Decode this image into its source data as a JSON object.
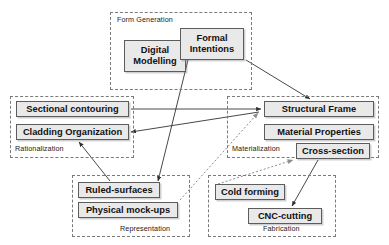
{
  "diagram": {
    "style": {
      "node_fill": "#e9e9e9",
      "node_border": "#5c5c5c",
      "group_border": "#7a7a7a",
      "arrow_color": "#333333",
      "dashed_arrow_color": "#8c8c8c",
      "background": "#ffffff"
    },
    "groups": [
      {
        "id": "form-generation",
        "label": "Form Generation",
        "x": 110,
        "y": 12,
        "w": 142,
        "h": 78,
        "label_x": 116,
        "label_y": 15,
        "label_align": "left"
      },
      {
        "id": "rationalization",
        "label": "Rationalization",
        "x": 10,
        "y": 96,
        "w": 124,
        "h": 62,
        "label_x": 14,
        "label_y": 144,
        "label_align": "left"
      },
      {
        "id": "materialization",
        "label": "Materialization",
        "x": 227,
        "y": 96,
        "w": 152,
        "h": 62,
        "label_x": 231,
        "label_y": 144,
        "label_align": "left"
      },
      {
        "id": "representation",
        "label": "Representation",
        "x": 72,
        "y": 175,
        "w": 118,
        "h": 62,
        "label_x": 119,
        "label_y": 224,
        "label_align": "right"
      },
      {
        "id": "fabrication",
        "label": "Fabrication",
        "x": 208,
        "y": 175,
        "w": 128,
        "h": 62,
        "label_x": 262,
        "label_y": 224,
        "label_align": "right"
      }
    ],
    "nodes": [
      {
        "id": "digital-modelling",
        "label": "Digital\nModelling",
        "x": 124,
        "y": 40,
        "w": 62,
        "h": 32,
        "group": "form-generation"
      },
      {
        "id": "formal-intentions",
        "label": "Formal\nIntentions",
        "x": 180,
        "y": 28,
        "w": 64,
        "h": 32,
        "group": "form-generation"
      },
      {
        "id": "sectional-contouring",
        "label": "Sectional contouring",
        "x": 16,
        "y": 101,
        "w": 113,
        "h": 16,
        "group": "rationalization"
      },
      {
        "id": "cladding-organization",
        "label": "Cladding Organization",
        "x": 16,
        "y": 124,
        "w": 113,
        "h": 16,
        "group": "rationalization"
      },
      {
        "id": "structural-frame",
        "label": "Structural Frame",
        "x": 264,
        "y": 101,
        "w": 110,
        "h": 16,
        "group": "materialization"
      },
      {
        "id": "material-properties",
        "label": "Material Properties",
        "x": 264,
        "y": 124,
        "w": 110,
        "h": 16,
        "group": "materialization"
      },
      {
        "id": "cross-section",
        "label": "Cross-section",
        "x": 296,
        "y": 143,
        "w": 74,
        "h": 16,
        "group": "materialization"
      },
      {
        "id": "ruled-surfaces",
        "label": "Ruled-surfaces",
        "x": 78,
        "y": 182,
        "w": 82,
        "h": 16,
        "group": "representation"
      },
      {
        "id": "physical-mock-ups",
        "label": "Physical mock-ups",
        "x": 78,
        "y": 202,
        "w": 100,
        "h": 16,
        "group": "representation"
      },
      {
        "id": "cold-forming",
        "label": "Cold forming",
        "x": 215,
        "y": 184,
        "w": 70,
        "h": 16,
        "group": "fabrication"
      },
      {
        "id": "cnc-cutting",
        "label": "CNC-cutting",
        "x": 248,
        "y": 208,
        "w": 74,
        "h": 16,
        "group": "fabrication"
      }
    ],
    "edges": [
      {
        "id": "edge-formal-intentions-to-structural-frame",
        "from": "formal-intentions",
        "to": "structural-frame",
        "style": "solid",
        "x1": 246,
        "y1": 60,
        "x2": 310,
        "y2": 99
      },
      {
        "id": "edge-formal-intentions-to-ruled-surfaces",
        "from": "formal-intentions",
        "to": "ruled-surfaces",
        "style": "solid",
        "x1": 188,
        "y1": 60,
        "x2": 158,
        "y2": 181
      },
      {
        "id": "edge-sectional-contouring-to-structural-frame",
        "from": "sectional-contouring",
        "to": "structural-frame",
        "style": "solid",
        "x1": 131,
        "y1": 109,
        "x2": 261,
        "y2": 109
      },
      {
        "id": "edge-structural-frame-to-cladding-organization",
        "from": "structural-frame",
        "to": "cladding-organization",
        "style": "solid",
        "x1": 259,
        "y1": 112,
        "x2": 131,
        "y2": 132
      },
      {
        "id": "edge-ruled-surfaces-to-cladding-organization",
        "from": "ruled-surfaces",
        "to": "cladding-organization",
        "style": "solid",
        "x1": 110,
        "y1": 181,
        "x2": 79,
        "y2": 142
      },
      {
        "id": "edge-physical-mock-ups-to-structural-frame",
        "from": "physical-mock-ups",
        "to": "structural-frame",
        "style": "dashed",
        "x1": 180,
        "y1": 200,
        "x2": 258,
        "y2": 113
      },
      {
        "id": "edge-cold-forming-to-cross-section",
        "from": "cold-forming",
        "to": "cross-section",
        "style": "dashed",
        "x1": 218,
        "y1": 184,
        "x2": 293,
        "y2": 160
      },
      {
        "id": "edge-cross-section-to-cnc-cutting",
        "from": "cross-section",
        "to": "cnc-cutting",
        "style": "solid",
        "x1": 318,
        "y1": 160,
        "x2": 292,
        "y2": 206
      }
    ]
  }
}
